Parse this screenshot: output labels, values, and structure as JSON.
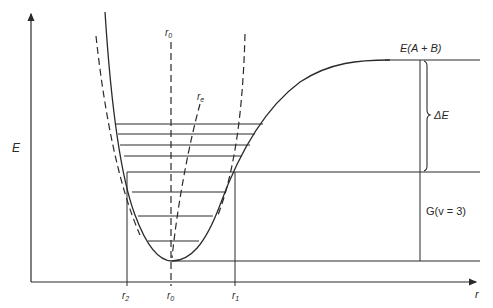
{
  "diagram": {
    "type": "potential-energy-curve",
    "axes": {
      "y_label": "E",
      "x_label": "r"
    },
    "labels": {
      "r0_top": "r",
      "r0_top_sub": "0",
      "re_curve": "r",
      "re_curve_sub": "e",
      "dissociation": "E(A + B)",
      "delta_e": "ΔE",
      "g_v3": "G(v = 3)",
      "r2": "r",
      "r2_sub": "2",
      "r0_bottom": "r",
      "r0_bottom_sub": "0",
      "r1": "r",
      "r1_sub": "1"
    },
    "vibrational_levels_y": [
      241,
      216,
      192,
      172,
      156,
      145,
      134,
      124
    ],
    "colors": {
      "line": "#2a2a2a",
      "background": "#ffffff"
    }
  }
}
